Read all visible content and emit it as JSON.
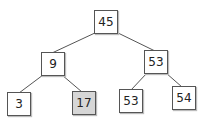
{
  "diagram": {
    "type": "binary-tree",
    "nodes": [
      {
        "id": "n45",
        "label": "45",
        "x": 94,
        "y": 10,
        "highlighted": false
      },
      {
        "id": "n9",
        "label": "9",
        "x": 41,
        "y": 52,
        "highlighted": false
      },
      {
        "id": "n53a",
        "label": "53",
        "x": 144,
        "y": 50,
        "highlighted": false
      },
      {
        "id": "n3",
        "label": "3",
        "x": 7,
        "y": 92,
        "highlighted": false
      },
      {
        "id": "n17",
        "label": "17",
        "x": 72,
        "y": 91,
        "highlighted": true
      },
      {
        "id": "n53b",
        "label": "53",
        "x": 119,
        "y": 89,
        "highlighted": false
      },
      {
        "id": "n54",
        "label": "54",
        "x": 172,
        "y": 86,
        "highlighted": false
      }
    ],
    "edges": [
      {
        "from": "n45",
        "to": "n9"
      },
      {
        "from": "n45",
        "to": "n53a"
      },
      {
        "from": "n9",
        "to": "n3"
      },
      {
        "from": "n9",
        "to": "n17"
      },
      {
        "from": "n53a",
        "to": "n53b"
      },
      {
        "from": "n53a",
        "to": "n54"
      }
    ],
    "colors": {
      "highlight": "#d6d6d6",
      "border": "#555555",
      "edge": "#555555"
    }
  }
}
